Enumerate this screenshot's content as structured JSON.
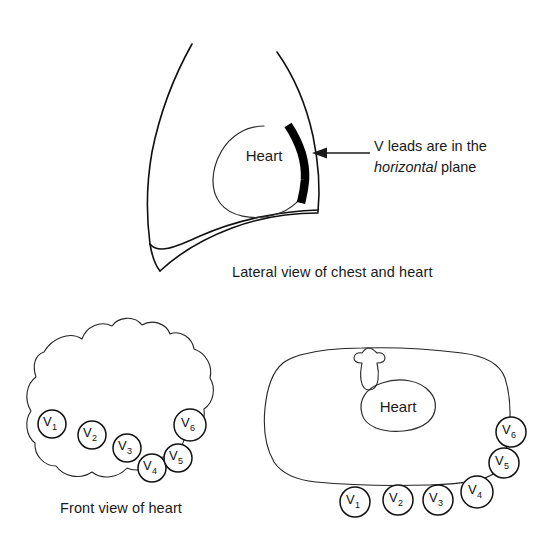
{
  "figure": {
    "background_color": "#ffffff",
    "ink_color": "#111111",
    "electrode_band_color": "#000000"
  },
  "panels": {
    "lateral": {
      "caption": "Lateral view of chest and heart",
      "organ_label": "Heart",
      "annotation_line_1": "V leads are in the",
      "annotation_emphasis": "horizontal",
      "annotation_line_2": " plane",
      "annotation_full": "V leads are in the horizontal plane",
      "arrow": "leftward-arrow"
    },
    "front": {
      "caption": "Front view of heart",
      "electrodes": [
        {
          "name": "V",
          "subscript": "1",
          "cx": 52,
          "cy": 424,
          "r": 14
        },
        {
          "name": "V",
          "subscript": "2",
          "cx": 92,
          "cy": 435,
          "r": 14
        },
        {
          "name": "V",
          "subscript": "3",
          "cx": 127,
          "cy": 448,
          "r": 14
        },
        {
          "name": "V",
          "subscript": "4",
          "cx": 152,
          "cy": 468,
          "r": 14
        },
        {
          "name": "V",
          "subscript": "5",
          "cx": 178,
          "cy": 458,
          "r": 14
        },
        {
          "name": "V",
          "subscript": "6",
          "cx": 190,
          "cy": 425,
          "r": 16
        }
      ]
    },
    "cross_section": {
      "organ_label": "Heart",
      "spine_icon": "vertebra-icon",
      "electrodes": [
        {
          "name": "V",
          "subscript": "1",
          "cx": 355,
          "cy": 502,
          "r": 15
        },
        {
          "name": "V",
          "subscript": "2",
          "cx": 398,
          "cy": 500,
          "r": 15
        },
        {
          "name": "V",
          "subscript": "3",
          "cx": 438,
          "cy": 500,
          "r": 15
        },
        {
          "name": "V",
          "subscript": "4",
          "cx": 477,
          "cy": 492,
          "r": 16
        },
        {
          "name": "V",
          "subscript": "5",
          "cx": 504,
          "cy": 463,
          "r": 15
        },
        {
          "name": "V",
          "subscript": "6",
          "cx": 511,
          "cy": 432,
          "r": 15
        }
      ]
    }
  }
}
